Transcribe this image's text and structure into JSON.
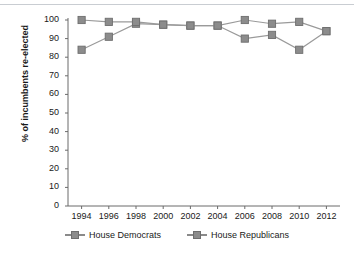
{
  "chart_data": {
    "type": "line",
    "title": "",
    "xlabel": "",
    "ylabel": "% of incumbents re-elected",
    "categories": [
      1994,
      1996,
      1998,
      2000,
      2002,
      2004,
      2006,
      2008,
      2010,
      2012
    ],
    "xlim": [
      1993,
      2013
    ],
    "ylim": [
      0,
      100
    ],
    "yticks": [
      0,
      10,
      20,
      30,
      40,
      50,
      60,
      70,
      80,
      90,
      100
    ],
    "xticks": [
      "1994",
      "1996",
      "1998",
      "2000",
      "2002",
      "2004",
      "2006",
      "2008",
      "2010",
      "2012"
    ],
    "grid": false,
    "legend_position": "bottom",
    "marker": "square",
    "series": [
      {
        "name": "House Democrats",
        "color": "#8c8c8c",
        "values": [
          84,
          91,
          98,
          97.5,
          97,
          97,
          90,
          92,
          84,
          94
        ]
      },
      {
        "name": "House Republicans",
        "color": "#8c8c8c",
        "values": [
          100,
          99,
          99,
          97.5,
          97,
          97,
          100,
          98,
          99,
          94
        ]
      }
    ]
  },
  "axis": {
    "line_color": "#6b6b6b"
  }
}
